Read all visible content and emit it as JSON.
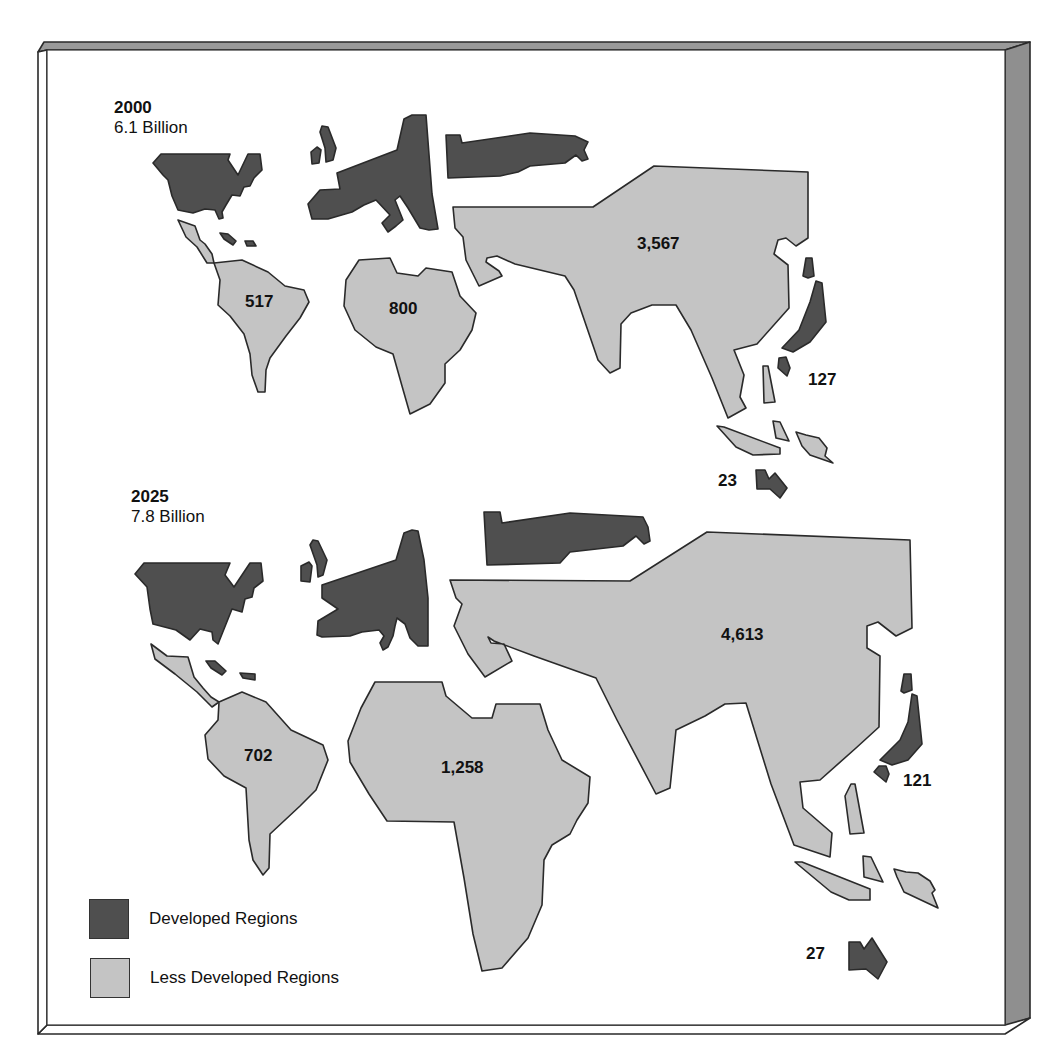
{
  "colors": {
    "developed": "#4f4f4f",
    "less_developed": "#c4c4c4"
  },
  "panels": [
    {
      "year": "2000",
      "total": "6.1 Billion",
      "regions": {
        "north_america": {
          "name": "North America",
          "category": "developed",
          "value": null
        },
        "europe": {
          "name": "Europe",
          "category": "developed",
          "value": null
        },
        "russia": {
          "name": "Russia",
          "category": "developed",
          "value": null
        },
        "latin_america": {
          "name": "Latin America",
          "category": "less_developed",
          "value": "517"
        },
        "africa": {
          "name": "Africa",
          "category": "less_developed",
          "value": "800"
        },
        "asia": {
          "name": "Asia",
          "category": "less_developed",
          "value": "3,567"
        },
        "japan": {
          "name": "Japan",
          "category": "developed",
          "value": "127"
        },
        "oceania": {
          "name": "Australia / New Zealand",
          "category": "developed",
          "value": "23"
        }
      }
    },
    {
      "year": "2025",
      "total": "7.8 Billion",
      "regions": {
        "north_america": {
          "name": "North America",
          "category": "developed",
          "value": null
        },
        "europe": {
          "name": "Europe",
          "category": "developed",
          "value": null
        },
        "russia": {
          "name": "Russia",
          "category": "developed",
          "value": null
        },
        "latin_america": {
          "name": "Latin America",
          "category": "less_developed",
          "value": "702"
        },
        "africa": {
          "name": "Africa",
          "category": "less_developed",
          "value": "1,258"
        },
        "asia": {
          "name": "Asia",
          "category": "less_developed",
          "value": "4,613"
        },
        "japan": {
          "name": "Japan",
          "category": "developed",
          "value": "121"
        },
        "oceania": {
          "name": "Australia / New Zealand",
          "category": "developed",
          "value": "27"
        }
      }
    }
  ],
  "legend": [
    {
      "label": "Developed Regions",
      "category": "developed"
    },
    {
      "label": "Less Developed Regions",
      "category": "less_developed"
    }
  ]
}
